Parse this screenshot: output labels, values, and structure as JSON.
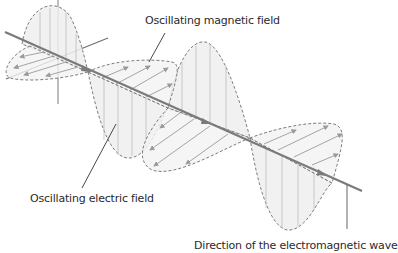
{
  "diagram": {
    "title": "Electromagnetic wave",
    "labels": {
      "magnetic": "Oscillating magnetic field",
      "electric": "Oscillating electric field",
      "direction": "Direction of the electromagnetic wave"
    },
    "colors": {
      "axis": "#7a7a7a",
      "dashed_outline": "#6e6e6e",
      "field_lines": "#9a9a9a",
      "lobe_fill": "#eeeeee",
      "text": "#2a2a2a",
      "background": "#ffffff"
    }
  }
}
